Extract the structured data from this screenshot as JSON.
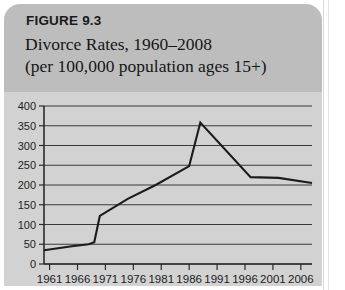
{
  "figure": {
    "label": "FIGURE 9.3",
    "title_line1": "Divorce Rates, 1960–2008",
    "title_line2": "(per 100,000 population ages 15+)"
  },
  "colors": {
    "header_band": "#bdbdbd",
    "plot_background": "#d2d2d2",
    "line": "#1b1b1b",
    "gridline": "#3a3a3a",
    "axis": "#2b2b2b",
    "page": "#ffffff"
  },
  "chart_data": {
    "type": "line",
    "title": "Divorce Rates, 1960–2008 (per 100,000 population ages 15+)",
    "xlabel": "",
    "ylabel": "",
    "xlim": [
      1960,
      2008
    ],
    "ylim": [
      0,
      400
    ],
    "ytick_values": [
      0,
      50,
      100,
      150,
      200,
      250,
      300,
      350,
      400
    ],
    "ytick_labels": [
      "0",
      "50",
      "100",
      "150",
      "200",
      "250",
      "300",
      "350",
      "400"
    ],
    "xtick_values": [
      1961,
      1966,
      1971,
      1976,
      1981,
      1986,
      1991,
      1996,
      2001,
      2006
    ],
    "xtick_labels": [
      "1961",
      "1966",
      "1971",
      "1976",
      "1981",
      "1986",
      "1991",
      "1996",
      "2001",
      "2006"
    ],
    "grid": "horizontal",
    "legend": "none",
    "series": [
      {
        "name": "Divorce rate per 100,000 population ages 15+",
        "x": [
          1960,
          1965,
          1968,
          1969,
          1970,
          1975,
          1980,
          1986,
          1988,
          1997,
          2002,
          2008
        ],
        "values": [
          35,
          45,
          50,
          55,
          122,
          165,
          200,
          248,
          358,
          220,
          218,
          205
        ]
      }
    ],
    "annotations": [
      "Rate roughly flat near 35–55 from 1960 to 1969",
      "Sharp jump to about 122 by 1970",
      "Steady rise to about 248 by 1986",
      "Peak of about 358 around 1988",
      "Steep decline to about 220 by 1997",
      "Gradual decline to about 205 by 2008"
    ]
  }
}
